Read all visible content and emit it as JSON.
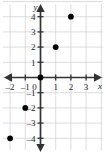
{
  "chart_data": {
    "type": "scatter",
    "title": "",
    "xlabel": "x",
    "ylabel": "y",
    "xlim": [
      -2.6,
      3.6
    ],
    "ylim": [
      -4.8,
      4.8
    ],
    "grid": true,
    "legend": "none",
    "x_ticks": [
      -2,
      -1,
      0,
      1,
      2,
      3
    ],
    "y_ticks": [
      -4,
      -3,
      -2,
      -1,
      1,
      2,
      3,
      4
    ],
    "x_tick_labels": [
      "–2",
      "–1",
      "0",
      "1",
      "2",
      "3"
    ],
    "y_tick_labels": [
      "–4",
      "–3",
      "–2",
      "–1",
      "1",
      "2",
      "3",
      "4"
    ],
    "origin_label": "0",
    "points": [
      {
        "x": -2,
        "y": -4
      },
      {
        "x": -1,
        "y": -2
      },
      {
        "x": 0,
        "y": 0
      },
      {
        "x": 1,
        "y": 2
      },
      {
        "x": 2,
        "y": 4
      }
    ],
    "point_color": "#000000",
    "axis_color": "#333333",
    "grid_color": "#cfcfd4",
    "background_color": "#ffffff"
  },
  "axes": {
    "x_name": "x",
    "y_name": "y"
  }
}
